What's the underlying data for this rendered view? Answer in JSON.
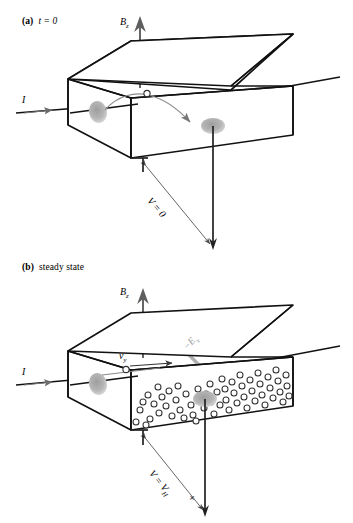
{
  "figure": {
    "type": "physics-diagram",
    "colors": {
      "outline": "#1a1a1a",
      "arrow_gray": "#6b6b6b",
      "arrow_light_gray": "#a8a8a8",
      "contact_blob": "#b3b3b3",
      "electron_circle_stroke": "#333333",
      "background": "#ffffff"
    }
  },
  "panels": [
    {
      "id": "a",
      "tag": "(a)",
      "caption": "t = 0",
      "caption_italic": true,
      "labels": {
        "b_field": "B",
        "b_field_sub": "z",
        "current": "I",
        "voltage": "V = 0"
      },
      "description": "At t = 0 a single electron is deflected by the magnetic force; no transverse voltage has built up yet."
    },
    {
      "id": "b",
      "tag": "(b)",
      "caption": "steady state",
      "caption_italic": false,
      "labels": {
        "b_field": "B",
        "b_field_sub": "z",
        "current": "I",
        "drift_velocity": "v",
        "drift_velocity_sub": "y",
        "hall_field": "−E",
        "hall_field_sub": "x",
        "voltage": "V = V",
        "voltage_sub": "H",
        "polarity": "+"
      },
      "description": "In steady state accumulated electrons set up a Hall field and a Hall voltage V = V_H appears across the slab."
    }
  ],
  "electron_counts": {
    "panel_a_free_electrons": 1,
    "panel_b_free_electrons": 58
  }
}
